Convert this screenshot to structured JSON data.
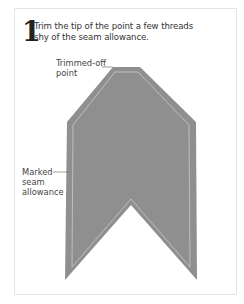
{
  "step": {
    "number": "1",
    "instruction_line1": "Trim the tip of the point a few threads",
    "instruction_line2": "shy of the seam allowance."
  },
  "labels": {
    "trimmed_line1": "Trimmed-off",
    "trimmed_line2": "point",
    "seam_line1": "Marked",
    "seam_line2": "seam",
    "seam_line3": "allowance"
  },
  "colors": {
    "fabric": "#8f8f8f",
    "seam_line": "#c9c9c9",
    "leader": "#777777"
  }
}
